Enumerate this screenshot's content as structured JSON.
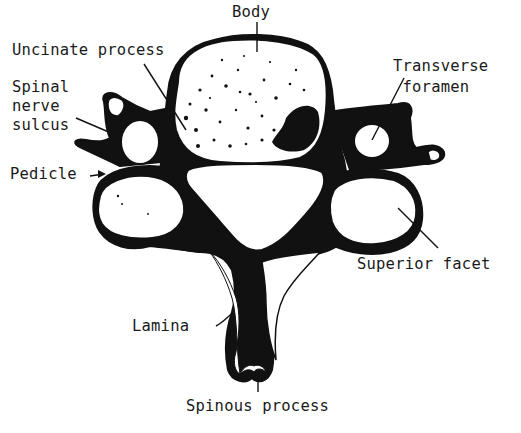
{
  "diagram": {
    "labels": {
      "body": "Body",
      "uncinate_process": "Uncinate process",
      "spinal_nerve_sulcus": "Spinal\nnerve\nsulcus",
      "pedicle": "Pedicle",
      "transverse_foramen": "Transverse\n foramen",
      "superior_facet": "Superior facet",
      "lamina": "Lamina",
      "spinous_process": "Spinous process"
    },
    "colors": {
      "ink": "#111111",
      "background": "#ffffff"
    }
  }
}
